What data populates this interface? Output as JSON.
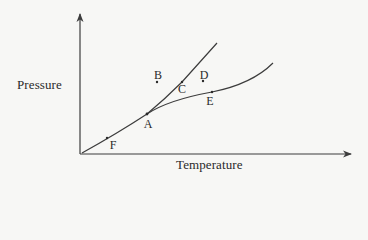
{
  "diagram": {
    "type": "phase-diagram",
    "axes": {
      "x_label": "Temperature",
      "y_label": "Pressure"
    },
    "colors": {
      "background": "#f7f7f5",
      "line": "#3c3c3c",
      "text": "#2a2a2a"
    },
    "points": [
      {
        "id": "A",
        "label": "A",
        "x": 147,
        "y": 114,
        "lx": 148,
        "ly": 124
      },
      {
        "id": "B",
        "label": "B",
        "x": 157,
        "y": 82,
        "lx": 158,
        "ly": 75
      },
      {
        "id": "C",
        "label": "C",
        "x": 182,
        "y": 82,
        "lx": 182,
        "ly": 89
      },
      {
        "id": "D",
        "label": "D",
        "x": 203,
        "y": 81,
        "lx": 204,
        "ly": 75
      },
      {
        "id": "E",
        "label": "E",
        "x": 212,
        "y": 92,
        "lx": 210,
        "ly": 101
      },
      {
        "id": "F",
        "label": "F",
        "x": 107,
        "y": 138,
        "lx": 113,
        "ly": 145
      }
    ],
    "curves": [
      {
        "name": "sublimation-curve",
        "description": "origin to A"
      },
      {
        "name": "melting-curve",
        "description": "A upward steep"
      },
      {
        "name": "vaporization-curve",
        "description": "A to right, shallower"
      }
    ]
  }
}
